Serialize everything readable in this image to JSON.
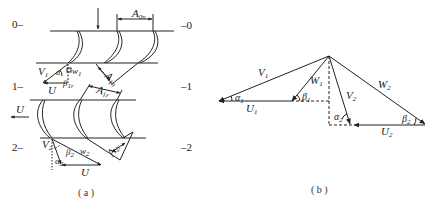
{
  "figure_a": {
    "caption": "( a )",
    "stations": [
      {
        "left": "0–",
        "right": "–0"
      },
      {
        "left": "1–",
        "right": "–1"
      },
      {
        "left": "2–",
        "right": "–2"
      }
    ],
    "labels": {
      "A0n": "A",
      "A0n_sub": "0n",
      "A1n_top": "A",
      "A1n_top_sub": "1n",
      "A1r": "A",
      "A1r_sub": "1r",
      "A2r": "A",
      "A2r_sub": "2r",
      "V1": "V",
      "V1_sub": "1",
      "W1": "w",
      "W1_sub": "1",
      "alpha1": "α",
      "alpha1_sub": "1",
      "beta1": "β",
      "beta1_sub": "1r",
      "U_top": "U",
      "U_mid": "U",
      "V2": "V",
      "V2_sub": "2",
      "W2": "w",
      "W2_sub": "2",
      "beta2": "β",
      "beta2_sub": "2",
      "alpha2": "α",
      "alpha2_sub": "2",
      "U_bot": "U"
    }
  },
  "figure_b": {
    "caption": "( b )",
    "labels": {
      "V1": "V",
      "V1_sub": "1",
      "W1": "W",
      "W1_sub": "1",
      "V2": "V",
      "V2_sub": "2",
      "W2": "W",
      "W2_sub": "2",
      "U1": "U",
      "U1_sub": "1",
      "U2": "U",
      "U2_sub": "2",
      "alpha1": "α",
      "alpha1_sub": "1",
      "beta1": "β",
      "beta1_sub": "1",
      "alpha2": "α",
      "alpha2_sub": "2",
      "beta2": "β",
      "beta2_sub": "2"
    }
  },
  "colors": {
    "line": "#222222",
    "background": "#ffffff"
  }
}
